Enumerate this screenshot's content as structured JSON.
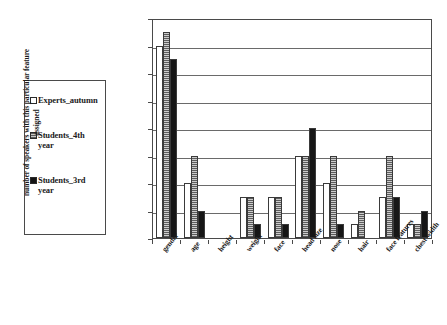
{
  "chart_data": {
    "type": "bar",
    "title": "",
    "subtitle": "",
    "xlabel": "",
    "ylabel": "number of speakers with this particular feature assigned",
    "ylim": [
      0,
      16
    ],
    "ytick_step": 2,
    "yticks": [
      "16",
      "14",
      "12",
      "10",
      "8",
      "6",
      "4",
      "2",
      "0"
    ],
    "grid": true,
    "grid_axis": "y",
    "legend_position": "left-outside",
    "categories": [
      "gender",
      "age",
      "height",
      "weight",
      "face",
      "head size",
      "nose",
      "hair",
      "face features",
      "chest width"
    ],
    "series": [
      {
        "name": "Experts_autumn",
        "marker": "open-square",
        "color": "#ffffff",
        "values": [
          14,
          4,
          0,
          3,
          3,
          6,
          4,
          1,
          3,
          1
        ]
      },
      {
        "name": "Students_4th year",
        "marker": "hatched-square",
        "color": "#9a9a9a",
        "values": [
          15,
          6,
          0,
          3,
          3,
          6,
          6,
          2,
          6,
          1
        ]
      },
      {
        "name": "Students_3rd year",
        "marker": "filled-square",
        "color": "#161616",
        "values": [
          13,
          2,
          0,
          1,
          1,
          8,
          1,
          0,
          3,
          2
        ]
      }
    ]
  },
  "legend": {
    "items": [
      {
        "label": "Experts_autumn",
        "swatch": "open-square-icon"
      },
      {
        "label": "Students_4th year",
        "swatch": "hatched-square-icon"
      },
      {
        "label": "Students_3rd year",
        "swatch": "filled-square-icon"
      }
    ]
  }
}
